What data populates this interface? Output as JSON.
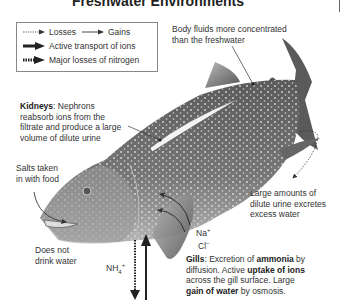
{
  "title": "Freshwater Environments",
  "legend": {
    "losses": "Losses",
    "gains": "Gains",
    "active_transport": "Active transport of ions",
    "nitrogen_losses": "Major losses of nitrogen"
  },
  "annotations": {
    "body_fluids": [
      "Body fluids more concentrated",
      "than the freshwater"
    ],
    "kidneys": {
      "heading": "Kidneys",
      "lines": [
        ": Nephrons",
        "reabsorb ions from the",
        "filtrate and produce a large",
        "volume of dilute urine"
      ]
    },
    "salts": [
      "Salts taken",
      "in with food"
    ],
    "drink": [
      "Does not",
      "drink water"
    ],
    "urine": [
      "Large amounts of",
      "dilute urine excretes",
      "excess water"
    ],
    "ions": {
      "na": "Na",
      "na_sup": "+",
      "cl": "Cl",
      "cl_sup": "−"
    },
    "ammonium": {
      "base": "NH",
      "sub": "4",
      "sup": "+"
    },
    "gills": {
      "heading": "Gills",
      "t1": ": Excretion of ",
      "b1": "ammonia",
      "t2": " by",
      "t3": "diffusion. Active ",
      "b2": "uptake of ions",
      "t4": "across the gill surface. Large",
      "b3": "gain of water",
      "t5": " by osmosis."
    }
  },
  "colors": {
    "fish_body": "#6e6e6e",
    "fish_belly": "#c8c8c8",
    "fish_dark": "#444444",
    "spots": "#e6e6e6",
    "text": "#333333",
    "arrow": "#222222"
  }
}
